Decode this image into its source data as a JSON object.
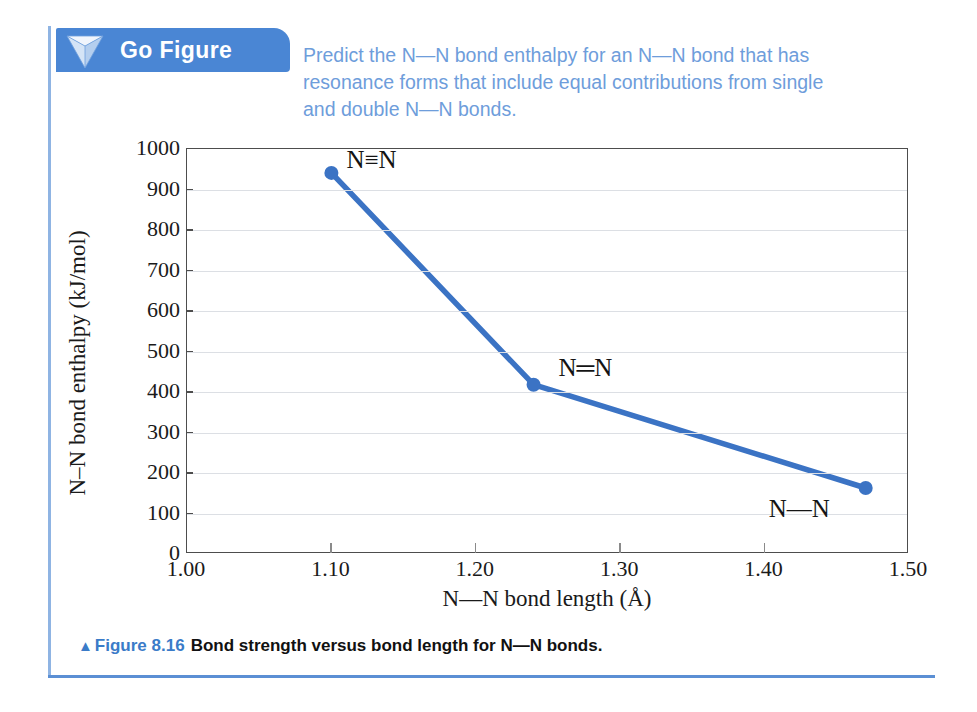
{
  "header": {
    "badge_label": "Go Figure",
    "icon": "tetrahedron-icon",
    "badge_color": "#4a86d4"
  },
  "question": {
    "lines": [
      "Predict the N—N bond enthalpy for an N—N bond that has",
      "resonance forms that include equal contributions from single",
      "and double N—N bonds."
    ],
    "color": "#6e9ddb"
  },
  "caption": {
    "marker": "▲",
    "figure_number": "Figure 8.16",
    "text": "Bond strength versus bond length for N—N bonds.",
    "number_color": "#3a7bc8"
  },
  "chart_data": {
    "type": "line",
    "title": "",
    "xlabel": "N—N bond length (Å)",
    "ylabel": "N–N bond enthalpy (kJ/mol)",
    "xlim": [
      1.0,
      1.5
    ],
    "ylim": [
      0,
      1000
    ],
    "xticks": [
      "1.00",
      "1.10",
      "1.20",
      "1.30",
      "1.40",
      "1.50"
    ],
    "xtick_values": [
      1.0,
      1.1,
      1.2,
      1.3,
      1.4,
      1.5
    ],
    "yticks": [
      "0",
      "100",
      "200",
      "300",
      "400",
      "500",
      "600",
      "700",
      "800",
      "900",
      "1000"
    ],
    "ytick_values": [
      0,
      100,
      200,
      300,
      400,
      500,
      600,
      700,
      800,
      900,
      1000
    ],
    "grid": true,
    "legend": "none",
    "line_color": "#3b73c4",
    "marker_color": "#3b73c4",
    "x": [
      1.1,
      1.24,
      1.47
    ],
    "y": [
      941,
      418,
      163
    ],
    "point_labels": [
      "N≡N",
      "N═N",
      "N—N"
    ],
    "points": [
      {
        "x": 1.1,
        "y": 941,
        "label": "N≡N",
        "bond": "triple"
      },
      {
        "x": 1.24,
        "y": 418,
        "label": "N═N",
        "bond": "double"
      },
      {
        "x": 1.47,
        "y": 163,
        "label": "N—N",
        "bond": "single"
      }
    ]
  }
}
